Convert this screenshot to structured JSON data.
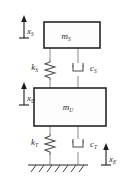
{
  "figure": {
    "type": "mechanical-schematic",
    "background_color": "#ffffff",
    "line_color": "#2b2b2b",
    "connector_color": "#8c8c8c"
  },
  "masses": [
    {
      "id": "upper-mass",
      "symbol": "m",
      "subscript": "S",
      "role": "sprung-mass"
    },
    {
      "id": "lower-mass",
      "symbol": "m",
      "subscript": "U",
      "role": "unsprung-mass"
    }
  ],
  "springs": [
    {
      "id": "suspension-spring",
      "symbol": "k",
      "subscript": "S"
    },
    {
      "id": "tire-spring",
      "symbol": "k",
      "subscript": "T"
    }
  ],
  "dampers": [
    {
      "id": "suspension-damper",
      "symbol": "c",
      "subscript": "S"
    },
    {
      "id": "tire-damper",
      "symbol": "c",
      "subscript": "T"
    }
  ],
  "displacements": [
    {
      "id": "upper-displacement",
      "symbol": "x",
      "subscript": "S",
      "direction": "up"
    },
    {
      "id": "lower-displacement",
      "symbol": "x",
      "subscript": "U",
      "direction": "up"
    },
    {
      "id": "ground-displacement",
      "symbol": "x",
      "subscript": "E",
      "direction": "up"
    }
  ],
  "ground": {
    "id": "ground-support",
    "hatch_count": 7
  }
}
